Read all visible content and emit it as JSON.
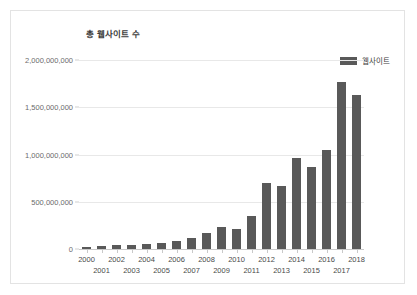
{
  "chart_title": "총 웹사이트 수",
  "legend": {
    "label": "웹사이트",
    "swatch_color": "#595959",
    "position": "top-right"
  },
  "colors": {
    "bar": "#595959",
    "gridline": "#e8e8e8",
    "axis": "#c9c9c9",
    "tick_text": "#6b6b6b",
    "title_text": "#3c3c3c",
    "card_border": "#e3e3e3",
    "background": "#ffffff"
  },
  "chart_data": {
    "type": "bar",
    "title": "총 웹사이트 수",
    "xlabel": "",
    "ylabel": "",
    "ylim": [
      0,
      2000000000
    ],
    "grid": true,
    "legend_position": "top-right",
    "series_name": "웹사이트",
    "categories": [
      "2000",
      "2001",
      "2002",
      "2003",
      "2004",
      "2005",
      "2006",
      "2007",
      "2008",
      "2009",
      "2010",
      "2011",
      "2012",
      "2013",
      "2014",
      "2015",
      "2016",
      "2017",
      "2018"
    ],
    "values": [
      17000000,
      29000000,
      38000000,
      40000000,
      51000000,
      64000000,
      85000000,
      121000000,
      172000000,
      238000000,
      207000000,
      346000000,
      697000000,
      672000000,
      968000000,
      863000000,
      1045000000,
      1766000000,
      1630000000
    ],
    "ytick_values": [
      0,
      500000000,
      1000000000,
      1500000000,
      2000000000
    ],
    "ytick_labels": [
      "0",
      "500,000,000",
      "1,000,000,000",
      "1,500,000,000",
      "2,000,000,000"
    ]
  }
}
